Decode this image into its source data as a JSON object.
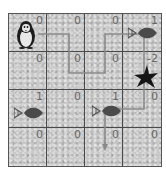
{
  "game": {
    "type": "gridworld",
    "rows": 4,
    "cols": 4,
    "agent": {
      "name": "penguin",
      "row": 0,
      "col": 0
    },
    "cells": [
      {
        "row": 0,
        "col": 0,
        "reward": "0",
        "content": "penguin"
      },
      {
        "row": 0,
        "col": 1,
        "reward": "0",
        "content": ""
      },
      {
        "row": 0,
        "col": 2,
        "reward": "0",
        "content": ""
      },
      {
        "row": 0,
        "col": 3,
        "reward": "1",
        "content": "fish"
      },
      {
        "row": 1,
        "col": 0,
        "reward": "0",
        "content": ""
      },
      {
        "row": 1,
        "col": 1,
        "reward": "0",
        "content": ""
      },
      {
        "row": 1,
        "col": 2,
        "reward": "0",
        "content": ""
      },
      {
        "row": 1,
        "col": 3,
        "reward": "-2",
        "content": "star"
      },
      {
        "row": 2,
        "col": 0,
        "reward": "1",
        "content": "fish"
      },
      {
        "row": 2,
        "col": 1,
        "reward": "0",
        "content": ""
      },
      {
        "row": 2,
        "col": 2,
        "reward": "1",
        "content": "fish"
      },
      {
        "row": 2,
        "col": 3,
        "reward": "0",
        "content": ""
      },
      {
        "row": 3,
        "col": 0,
        "reward": "0",
        "content": ""
      },
      {
        "row": 3,
        "col": 1,
        "reward": "0",
        "content": ""
      },
      {
        "row": 3,
        "col": 2,
        "reward": "0",
        "content": ""
      },
      {
        "row": 3,
        "col": 3,
        "reward": "0",
        "content": ""
      }
    ],
    "path_color": "#8a8a8a",
    "grid_color": "#4a4a4a",
    "tile_color": "#c9c9c9"
  }
}
